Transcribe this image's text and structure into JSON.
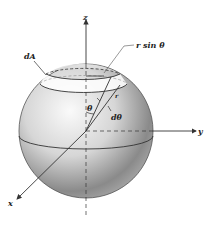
{
  "diagram": {
    "labels": {
      "z_axis": "z",
      "y_axis": "y",
      "x_axis": "x",
      "area_element": "dA",
      "ring_radius": "r sin θ",
      "polar_angle": "θ",
      "angle_increment": "dθ",
      "radius": "r"
    },
    "colors": {
      "line": "#333333",
      "sphere_light": "#f2f2f2",
      "sphere_mid": "#bdbdbd",
      "sphere_dark": "#6e6e6e",
      "background": "#ffffff"
    }
  }
}
